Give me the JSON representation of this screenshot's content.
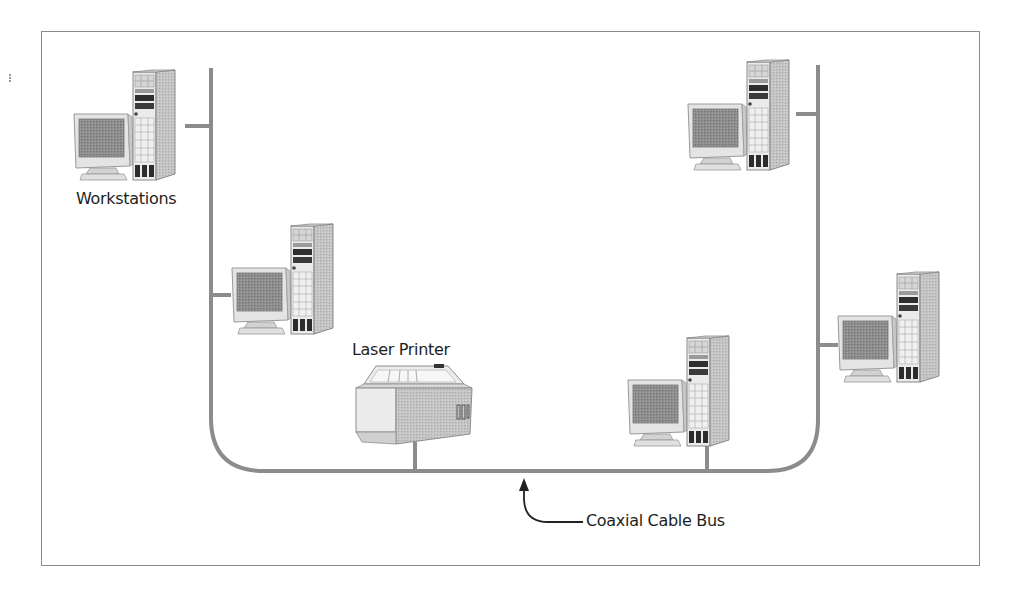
{
  "diagram": {
    "type": "bus-network-topology",
    "colors": {
      "cable": "#8c8c8c",
      "frame": "#8a8a8a",
      "text": "#1e1e1e",
      "device_light": "#e6e6e6",
      "device_mid": "#bdbdbd",
      "device_dark": "#5a5a5a",
      "screen": "#8e8e8e"
    },
    "labels": {
      "workstations": "Workstations",
      "laser_printer": "Laser Printer",
      "coaxial_cable_bus": "Coaxial Cable Bus"
    },
    "nodes": [
      {
        "id": "workstation-1",
        "kind": "workstation",
        "x": 72,
        "y": 70,
        "connects_to": "left-bus"
      },
      {
        "id": "workstation-2",
        "kind": "workstation",
        "x": 230,
        "y": 224,
        "connects_to": "left-bus"
      },
      {
        "id": "laser-printer",
        "kind": "printer",
        "x": 356,
        "y": 362,
        "connects_to": "bottom-bus"
      },
      {
        "id": "workstation-3",
        "kind": "workstation",
        "x": 626,
        "y": 336,
        "connects_to": "bottom-bus"
      },
      {
        "id": "workstation-4",
        "kind": "workstation",
        "x": 686,
        "y": 60,
        "connects_to": "right-bus"
      },
      {
        "id": "workstation-5",
        "kind": "workstation",
        "x": 836,
        "y": 272,
        "connects_to": "right-bus"
      }
    ]
  }
}
